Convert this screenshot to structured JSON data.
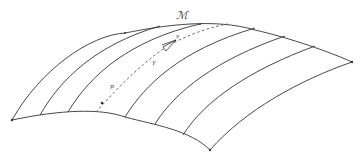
{
  "diagram": {
    "manifold_label": "ℳ",
    "vector_label": "v",
    "curve_label": "γ",
    "point_label": "p",
    "stroke_color": "#333333",
    "dash_color": "#555555",
    "background": "#ffffff"
  }
}
